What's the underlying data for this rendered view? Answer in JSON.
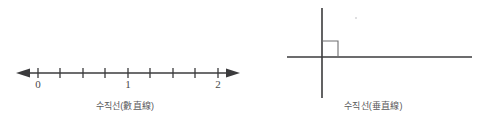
{
  "page": {
    "background_color": "#ffffff",
    "ink_color": "#3b3b3d",
    "caption_color": "#59595b",
    "width": 497,
    "height": 137
  },
  "figures": [
    {
      "id": "number-line",
      "caption": "수직선(數直線)",
      "type": "number-line",
      "axis": {
        "orientation": "horizontal",
        "y": 73,
        "x_start": 22,
        "x_end": 234,
        "arrow_left": true,
        "arrow_right": true
      },
      "tick_positions_px": [
        38,
        60,
        83,
        105,
        128,
        150,
        173,
        195,
        218
      ],
      "tick_half_height": 5,
      "labeled_ticks": [
        {
          "label": "0",
          "x": 38
        },
        {
          "label": "1",
          "x": 128
        },
        {
          "label": "2",
          "x": 218
        }
      ],
      "tick_label_y": 88,
      "tick_interval_value": 0.25,
      "range": [
        0,
        2
      ]
    },
    {
      "id": "perpendicular-lines",
      "caption": "수직선(垂直線)",
      "type": "perpendicular-lines",
      "horizontal_line": {
        "x_start": 37,
        "x_end": 222,
        "y": 57
      },
      "vertical_line": {
        "x": 72,
        "y_start": 8,
        "y_end": 98
      },
      "right_angle_marker": {
        "x": 72,
        "y": 57,
        "size": 16,
        "quadrant": "upper-right"
      },
      "speck_artifact": {
        "x": 106,
        "y": 18
      }
    }
  ]
}
